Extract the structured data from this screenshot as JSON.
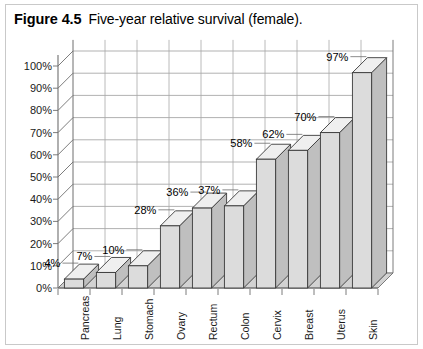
{
  "figure": {
    "label": "Figure 4.5",
    "caption": "Five-year relative survival (female)."
  },
  "chart_data": {
    "type": "bar",
    "title": "Five-year relative survival (female).",
    "xlabel": "",
    "ylabel": "",
    "ylim": [
      0,
      100
    ],
    "ytick_labels": [
      "0%",
      "10%",
      "20%",
      "30%",
      "40%",
      "50%",
      "60%",
      "70%",
      "80%",
      "90%",
      "100%"
    ],
    "ytick_values": [
      0,
      10,
      20,
      30,
      40,
      50,
      60,
      70,
      80,
      90,
      100
    ],
    "grid": true,
    "legend": false,
    "three_d": true,
    "categories": [
      "Pancreas",
      "Lung",
      "Stomach",
      "Ovary",
      "Rectum",
      "Colon",
      "Cervix",
      "Breast",
      "Uterus",
      "Skin"
    ],
    "values": [
      4,
      7,
      10,
      28,
      36,
      37,
      58,
      62,
      70,
      97
    ],
    "data_labels": [
      "4%",
      "7%",
      "10%",
      "28%",
      "36%",
      "37%",
      "58%",
      "62%",
      "70%",
      "97%"
    ]
  },
  "colors": {
    "bar_front": "#dcdcdc",
    "bar_side": "#bfbfbf",
    "bar_top": "#efefef",
    "bar_outline": "#3a3a3a",
    "floor": "#d2d2d2",
    "gridline": "#a8a8a8",
    "axis": "#6e6e6e",
    "frame": "#c9c9c9",
    "text": "#1a1a1a",
    "background": "#ffffff"
  }
}
